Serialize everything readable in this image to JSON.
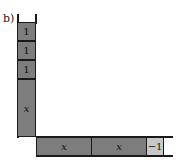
{
  "diagram": {
    "label": "b)",
    "vertical_column": [
      {
        "text": "1",
        "kind": "unit",
        "sign": "positive"
      },
      {
        "text": "1",
        "kind": "unit",
        "sign": "positive"
      },
      {
        "text": "1",
        "kind": "unit",
        "sign": "positive"
      },
      {
        "text": "x",
        "kind": "variable",
        "sign": "positive"
      }
    ],
    "horizontal_row": [
      {
        "text": "x",
        "kind": "variable",
        "sign": "positive"
      },
      {
        "text": "x",
        "kind": "variable",
        "sign": "positive"
      },
      {
        "text": "−1",
        "kind": "unit",
        "sign": "negative"
      }
    ],
    "colors": {
      "positive_tile": "#7d7d7d",
      "negative_tile": "#c8c8c8",
      "outline": "#1a1a1a"
    }
  }
}
